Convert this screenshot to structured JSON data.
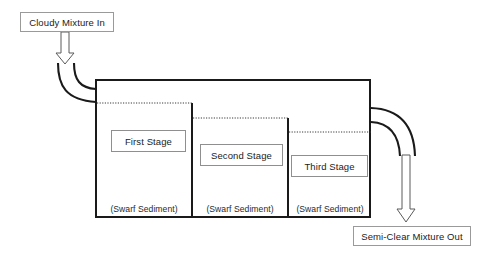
{
  "diagram": {
    "type": "process-flow-schematic",
    "colors": {
      "background": "#ffffff",
      "tank_outline": "#1a1a1a",
      "divider_wall": "#1a1a1a",
      "liquid_level_line": "#333333",
      "pipe": "#1a1a1a",
      "arrow_outline": "#555555",
      "arrow_fill": "#ffffff",
      "callout_border": "#9a9a9a",
      "stage_box_border": "#8f8f8f",
      "text": "#222222"
    },
    "inlet": {
      "label": "Cloudy Mixture In",
      "arrow_direction": "down",
      "pipe_curves": 2
    },
    "outlet": {
      "label": "Semi-Clear Mixture Out",
      "arrow_direction": "down",
      "pipe_curves": 2
    },
    "sediment_label": "(Swarf Sediment)",
    "stages": [
      {
        "label": "First Stage",
        "sediment": "(Swarf Sediment)"
      },
      {
        "label": "Second Stage",
        "sediment": "(Swarf Sediment)"
      },
      {
        "label": "Third Stage",
        "sediment": "(Swarf Sediment)"
      }
    ]
  }
}
